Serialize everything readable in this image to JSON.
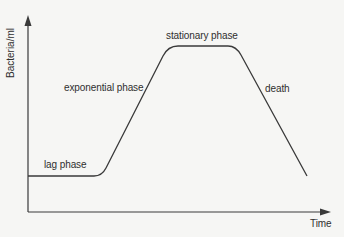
{
  "diagram": {
    "y_axis_label": "Bacteria/ml",
    "x_axis_label": "Time",
    "phases": [
      {
        "label": "lag phase"
      },
      {
        "label": "exponential phase"
      },
      {
        "label": "stationary phase"
      },
      {
        "label": "death"
      }
    ],
    "colors": {
      "background": "#f6f6f4",
      "line": "#3a3a3a",
      "text": "#2f2f2f"
    }
  }
}
